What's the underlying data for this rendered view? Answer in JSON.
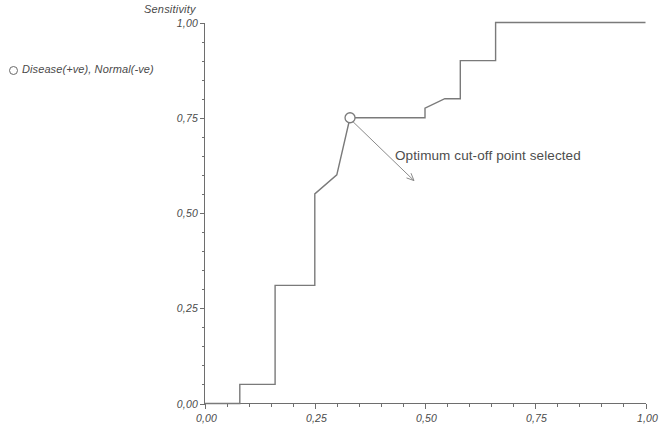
{
  "chart_data": {
    "type": "line",
    "title": "",
    "xlabel": "",
    "ylabel": "Sensitivity",
    "xlim": [
      0.0,
      1.0
    ],
    "ylim": [
      0.0,
      1.0
    ],
    "grid": false,
    "legend_position": "top-left-outside",
    "x_tick_labels": [
      "0,00",
      "0,25",
      "0,50",
      "0,75",
      "1,00"
    ],
    "x_tick_values": [
      0.0,
      0.25,
      0.5,
      0.75,
      1.0
    ],
    "y_tick_labels": [
      "0,00",
      "0,25",
      "0,50",
      "0,75",
      "1,00"
    ],
    "y_tick_values": [
      0.0,
      0.25,
      0.5,
      0.75,
      1.0
    ],
    "minor_ticks_per_interval": 4,
    "series": [
      {
        "name": "Disease(+ve), Normal(-ve)",
        "marker": "circle-open",
        "x": [
          0.0,
          0.08,
          0.08,
          0.16,
          0.16,
          0.25,
          0.25,
          0.3,
          0.33,
          0.33,
          0.5,
          0.5,
          0.545,
          0.58,
          0.58,
          0.66,
          0.66,
          1.0
        ],
        "y": [
          0.0,
          0.0,
          0.05,
          0.05,
          0.31,
          0.31,
          0.55,
          0.6,
          0.75,
          0.75,
          0.75,
          0.775,
          0.8,
          0.8,
          0.9,
          0.9,
          1.0,
          1.0
        ]
      }
    ],
    "annotations": [
      {
        "text": "Optimum cut-off point selected",
        "point_x": 0.33,
        "point_y": 0.75,
        "arrow_from_x": 0.475,
        "arrow_from_y": 0.585
      }
    ],
    "legend_entries": [
      {
        "label": "Disease(+ve), Normal(-ve)",
        "marker": "circle-open"
      }
    ]
  },
  "legend": {
    "entry_label": "Disease(+ve), Normal(-ve)"
  },
  "axes": {
    "y_title": "Sensitivity"
  },
  "annotation": {
    "text": "Optimum cut-off point selected"
  },
  "colors": {
    "line": "#7a7a7a",
    "axis": "#6e6e6e",
    "text": "#4a4a4a",
    "background": "#ffffff"
  }
}
